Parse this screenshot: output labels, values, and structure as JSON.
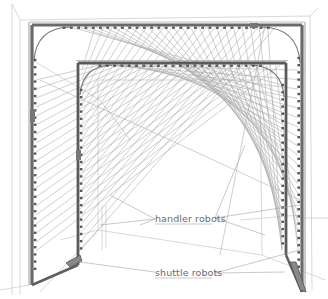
{
  "diagram": {
    "type": "perspective-illustration",
    "labels": {
      "handler": "handler robots",
      "shuttle": "shuttle robots"
    },
    "colors": {
      "background": "#ffffff",
      "rail": "#6e6e6e",
      "rail_dark": "#4a4a4a",
      "string_lines": "#9a9a9a",
      "room_lines": "#c8c8c8",
      "label_text": "#6a6a6a",
      "leader_lines": "#a0a0a0"
    },
    "outer_frame": {
      "left": 32,
      "right": 302,
      "top": 25,
      "left_bottom": 285,
      "right_bottom": 292,
      "corner_radius": 26
    },
    "inner_frame": {
      "left": 78,
      "right": 286,
      "top": 63,
      "left_bottom": 265,
      "right_bottom": 255,
      "corner_radius": 22
    }
  }
}
